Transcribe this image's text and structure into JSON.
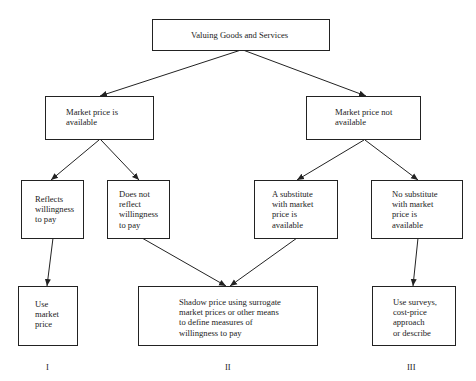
{
  "diagram": {
    "root": {
      "label": "Valuing Goods and Services"
    },
    "level1": [
      {
        "id": "available",
        "label": "Market price is\navailable"
      },
      {
        "id": "not_available",
        "label": "Market price not\navailable"
      }
    ],
    "level2": [
      {
        "id": "reflects",
        "label": "Reflects\nwillingness\nto pay"
      },
      {
        "id": "not_reflect",
        "label": "Does not\nreflect\nwillingness\nto pay"
      },
      {
        "id": "substitute",
        "label": "A substitute\nwith market\nprice is\navailable"
      },
      {
        "id": "no_substitute",
        "label": "No substitute\nwith market\nprice is\navailable"
      }
    ],
    "outcomes": [
      {
        "id": "use_market",
        "label": "Use\nmarket\nprice",
        "category": "I"
      },
      {
        "id": "shadow",
        "label": "Shadow price using surrogate\nmarket prices or other means\nto define measures of\nwillingness to pay",
        "category": "II"
      },
      {
        "id": "surveys",
        "label": "Use surveys,\ncost-price\napproach\nor describe",
        "category": "III"
      }
    ],
    "edges": [
      [
        "root",
        "available"
      ],
      [
        "root",
        "not_available"
      ],
      [
        "available",
        "reflects"
      ],
      [
        "available",
        "not_reflect"
      ],
      [
        "not_available",
        "substitute"
      ],
      [
        "not_available",
        "no_substitute"
      ],
      [
        "reflects",
        "use_market"
      ],
      [
        "not_reflect",
        "shadow"
      ],
      [
        "substitute",
        "shadow"
      ],
      [
        "no_substitute",
        "surveys"
      ]
    ]
  }
}
